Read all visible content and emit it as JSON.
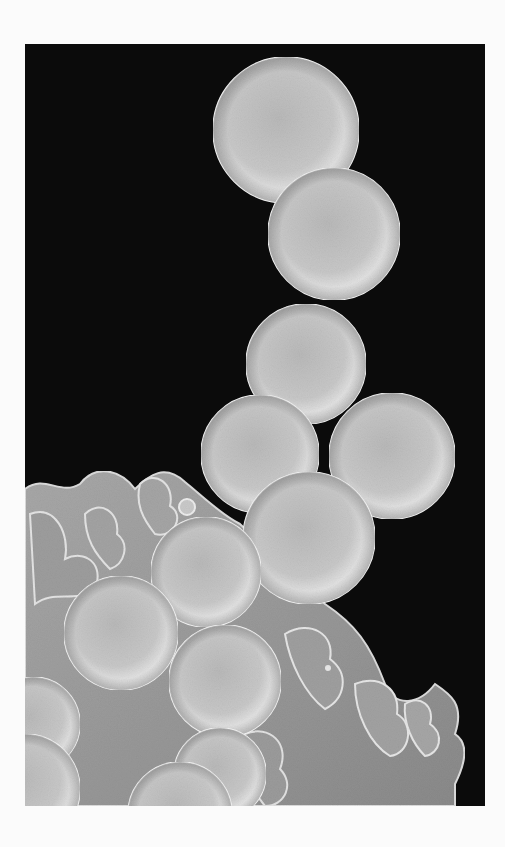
{
  "image": {
    "kind": "scanning electron micrograph",
    "subject": "chain and cluster of spherical cocci bacteria on a cell surface",
    "background_color": "#0b0b0b",
    "border_color": "#fbfbfb",
    "frame": {
      "x": 25,
      "y": 44,
      "width": 460,
      "height": 762
    },
    "sphere_color_light": "#ececec",
    "sphere_color_mid": "#bdbdbd",
    "sphere_color_dark": "#7a7a7a",
    "membrane_color": "#9a9a9a",
    "membrane_edge_color": "#e2e2e2"
  },
  "cocci": [
    {
      "cx": 261,
      "cy": 86,
      "r": 73
    },
    {
      "cx": 309,
      "cy": 190,
      "r": 66
    },
    {
      "cx": 281,
      "cy": 320,
      "r": 60
    },
    {
      "cx": 367,
      "cy": 412,
      "r": 63
    },
    {
      "cx": 235,
      "cy": 410,
      "r": 59
    },
    {
      "cx": 284,
      "cy": 494,
      "r": 66
    },
    {
      "cx": 181,
      "cy": 528,
      "r": 55
    },
    {
      "cx": 96,
      "cy": 589,
      "r": 57
    },
    {
      "cx": 200,
      "cy": 637,
      "r": 56
    },
    {
      "cx": 8,
      "cy": 680,
      "r": 47
    },
    {
      "cx": 195,
      "cy": 730,
      "r": 46
    },
    {
      "cx": 155,
      "cy": 770,
      "r": 52
    },
    {
      "cx": 0,
      "cy": 745,
      "r": 55
    }
  ]
}
